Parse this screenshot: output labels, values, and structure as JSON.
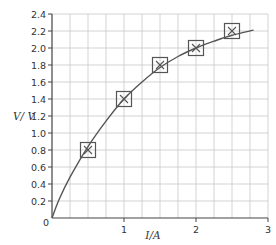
{
  "chart_data": {
    "type": "scatter",
    "title": "",
    "xlabel": "I/A",
    "ylabel": "V/ V",
    "xlim": [
      0,
      3
    ],
    "ylim": [
      0,
      2.4
    ],
    "grid": true,
    "x_ticks": [
      "0",
      "1",
      "2",
      "3"
    ],
    "y_ticks": [
      "0.2",
      "0.4",
      "0.6",
      "0.8",
      "1.0",
      "1.2",
      "1.4",
      "1.6",
      "1.8",
      "2.0",
      "2.2",
      "2.4"
    ],
    "origin_label": "0",
    "series": [
      {
        "name": "measured points",
        "marker": "cross-in-square",
        "x": [
          0.5,
          1.0,
          1.5,
          2.0,
          2.5
        ],
        "y": [
          0.8,
          1.4,
          1.8,
          2.0,
          2.2
        ]
      },
      {
        "name": "best-fit curve",
        "style": "line",
        "x": [
          0,
          0.1,
          0.25,
          0.5,
          0.75,
          1.0,
          1.25,
          1.5,
          1.75,
          2.0,
          2.25,
          2.5,
          2.8
        ],
        "y": [
          0,
          0.22,
          0.48,
          0.84,
          1.14,
          1.4,
          1.6,
          1.77,
          1.9,
          2.0,
          2.08,
          2.15,
          2.21
        ]
      }
    ],
    "colors": {
      "grid": "#c8c8c8",
      "axis": "#444444",
      "curve": "#555555",
      "marker": "#555555"
    }
  }
}
